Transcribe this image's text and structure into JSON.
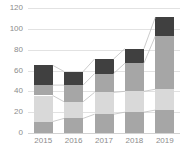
{
  "chart_data": {
    "type": "bar",
    "stacked": true,
    "title": "",
    "subtitle": "",
    "xlabel": "",
    "ylabel": "",
    "categories": [
      "2015",
      "2016",
      "2017",
      "2018",
      "2019"
    ],
    "ylim": [
      0,
      120
    ],
    "yticks": [
      0,
      20,
      40,
      60,
      80,
      100,
      120
    ],
    "ytick_labels": [
      "0",
      "20",
      "40",
      "60",
      "80",
      "100",
      "120"
    ],
    "grid": true,
    "legend": "none",
    "connectors": true,
    "series": [
      {
        "name": "Series 1",
        "color": "#a6a6a6",
        "values": [
          11,
          14,
          18,
          20,
          22
        ]
      },
      {
        "name": "Series 2",
        "color": "#d9d9d9",
        "values": [
          25,
          16,
          21,
          20,
          20
        ]
      },
      {
        "name": "Series 3",
        "color": "#a6a6a6",
        "values": [
          10,
          16,
          18,
          27,
          51
        ]
      },
      {
        "name": "Series 4",
        "color": "#404040",
        "values": [
          19,
          13,
          14,
          14,
          18
        ]
      }
    ],
    "totals": [
      65,
      59,
      71,
      81,
      111
    ]
  },
  "colors": {
    "background": "#ffffff",
    "gridline": "#e2e2e2",
    "axis": "#d2d2d2",
    "tick_text": "#8c8c8c",
    "connector": "#bfbfbf"
  }
}
